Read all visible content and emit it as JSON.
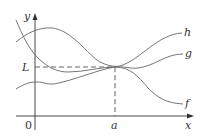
{
  "diagram": {
    "axes": {
      "x_label": "x",
      "y_label": "y",
      "origin_label": "0"
    },
    "markers": {
      "x_marker": "a",
      "y_marker": "L"
    },
    "curves": [
      {
        "name": "h",
        "label": "h",
        "position": "top"
      },
      {
        "name": "g",
        "label": "g",
        "position": "middle"
      },
      {
        "name": "f",
        "label": "f",
        "position": "bottom"
      }
    ],
    "colors": {
      "curve": "#666666",
      "axis": "#333333",
      "dashed": "#555555"
    }
  }
}
